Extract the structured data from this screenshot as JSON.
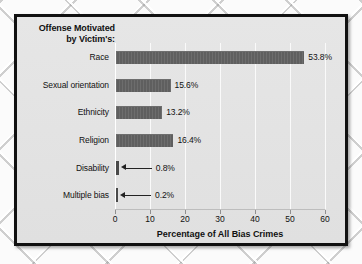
{
  "chart_data": {
    "type": "bar",
    "orientation": "horizontal",
    "title": "Offense Motivated by Victim's:",
    "title_lines": [
      "Offense Motivated",
      "by Victim's:"
    ],
    "categories": [
      "Race",
      "Sexual orientation",
      "Ethnicity",
      "Religion",
      "Disability",
      "Multiple bias"
    ],
    "values": [
      53.8,
      15.6,
      13.2,
      16.4,
      0.8,
      0.2
    ],
    "value_labels": [
      "53.8%",
      "15.6%",
      "13.2%",
      "16.4%",
      "0.8%",
      "0.2%"
    ],
    "xlabel": "Percentage of All Bias Crimes",
    "ylabel": "",
    "xlim": [
      0,
      60
    ],
    "xticks": [
      0,
      10,
      20,
      30,
      40,
      50,
      60
    ],
    "xtick_labels": [
      "0",
      "10",
      "20",
      "30",
      "40",
      "50",
      "60"
    ],
    "grid": true,
    "legend": "none",
    "bar_color": "#5f5f5f",
    "plot_background": "#e3e3e3",
    "annotations": [
      {
        "category": "Disability",
        "style": "leader-arrow",
        "label": "0.8%"
      },
      {
        "category": "Multiple bias",
        "style": "leader-arrow",
        "label": "0.2%"
      }
    ]
  }
}
